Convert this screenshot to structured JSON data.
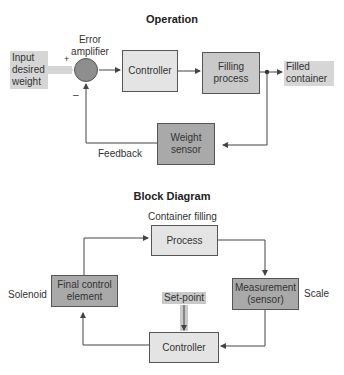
{
  "operation": {
    "title": "Operation",
    "input_label": [
      "Input",
      "desired",
      "weight"
    ],
    "error_amplifier_label": [
      "Error",
      "amplifier"
    ],
    "plus_sign": "+",
    "minus_sign": "–",
    "controller": "Controller",
    "filling_process": [
      "Filling",
      "process"
    ],
    "output_label": [
      "Filled",
      "container"
    ],
    "weight_sensor": [
      "Weight",
      "sensor"
    ],
    "feedback_label": "Feedback"
  },
  "block_diagram": {
    "title": "Block Diagram",
    "process_caption": "Container filling",
    "process": "Process",
    "final_control_element": [
      "Final control",
      "element"
    ],
    "final_control_caption": "Solenoid",
    "measurement": [
      "Measurement",
      "(sensor)"
    ],
    "measurement_caption": "Scale",
    "set_point": "Set-point",
    "controller": "Controller"
  },
  "colors": {
    "light_box": "#e4e4e4",
    "dark_box": "#a9a9a9",
    "input_shade": "#d6d6d6",
    "line": "#444444"
  }
}
